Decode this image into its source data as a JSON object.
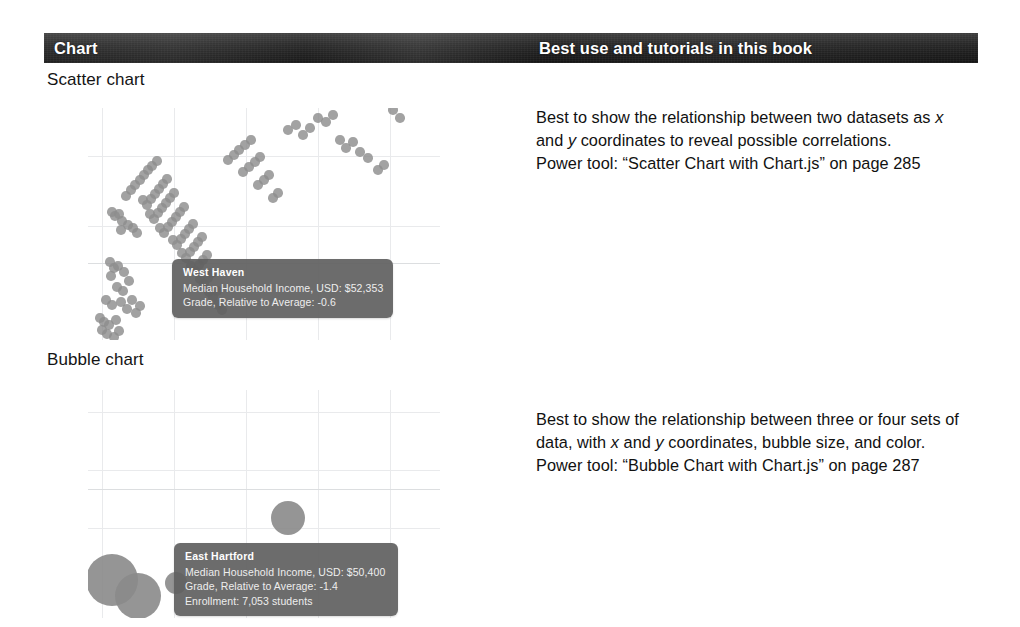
{
  "header": {
    "col_chart": "Chart",
    "col_usage": "Best use and tutorials in this book"
  },
  "sections": [
    {
      "label": "Scatter chart",
      "description_lines": [
        "Best to show the relationship between two datasets as x",
        "and y coordinates to reveal possible correlations.",
        "Power tool: “Scatter Chart with Chart.js” on page 285"
      ],
      "power_tool": "Power tool: “Scatter Chart with Chart.js” on page 285",
      "page": "285",
      "tooltip": {
        "title": "West Haven",
        "rows": [
          "Median Household Income, USD: $52,353",
          "Grade, Relative to Average: -0.6"
        ]
      }
    },
    {
      "label": "Bubble chart",
      "description_lines": [
        "Best to show the relationship between three or four sets of",
        "data, with x and y coordinates, bubble size, and color.",
        "Power tool: “Bubble Chart with Chart.js” on page 287"
      ],
      "power_tool": "Power tool: “Bubble Chart with Chart.js” on page 287",
      "page": "287",
      "tooltip": {
        "title": "East Hartford",
        "rows": [
          "Median Household Income, USD: $50,400",
          "Grade, Relative to Average: -1.4",
          "Enrollment: 7,053 students"
        ]
      }
    }
  ],
  "colors": {
    "header_bar": "#262626",
    "header_text": "#ffffff",
    "dot": "#8d8d8d",
    "bubble": "#8a8a8a",
    "gridline": "#e9eaec",
    "tooltip_bg": "#606060",
    "body_text": "#111111"
  },
  "chart_data": [
    {
      "type": "scatter",
      "title": "Scatter chart",
      "xlabel": "Median Household Income, USD",
      "ylabel": "Grade, Relative to Average",
      "grid": true,
      "legend": "none",
      "highlighted_point": {
        "label": "West Haven",
        "income_usd": 52353,
        "grade_relative_to_average": -0.6
      },
      "points": [
        [
          24,
          212
        ],
        [
          27,
          216
        ],
        [
          31,
          214
        ],
        [
          34,
          221
        ],
        [
          40,
          225
        ],
        [
          33,
          230
        ],
        [
          45,
          228
        ],
        [
          49,
          233
        ],
        [
          22,
          262
        ],
        [
          26,
          268
        ],
        [
          30,
          266
        ],
        [
          23,
          276
        ],
        [
          36,
          272
        ],
        [
          41,
          281
        ],
        [
          29,
          287
        ],
        [
          35,
          291
        ],
        [
          18,
          300
        ],
        [
          24,
          305
        ],
        [
          33,
          302
        ],
        [
          39,
          309
        ],
        [
          44,
          300
        ],
        [
          48,
          313
        ],
        [
          52,
          306
        ],
        [
          12,
          318
        ],
        [
          16,
          322
        ],
        [
          21,
          325
        ],
        [
          28,
          320
        ],
        [
          14,
          330
        ],
        [
          19,
          334
        ],
        [
          26,
          337
        ],
        [
          31,
          331
        ],
        [
          8,
          345
        ],
        [
          13,
          348
        ],
        [
          17,
          352
        ],
        [
          23,
          349
        ],
        [
          29,
          355
        ],
        [
          35,
          350
        ],
        [
          41,
          358
        ],
        [
          38,
          196
        ],
        [
          43,
          190
        ],
        [
          47,
          185
        ],
        [
          52,
          180
        ],
        [
          56,
          175
        ],
        [
          60,
          170
        ],
        [
          64,
          166
        ],
        [
          69,
          161
        ],
        [
          55,
          200
        ],
        [
          59,
          205
        ],
        [
          63,
          199
        ],
        [
          67,
          194
        ],
        [
          71,
          189
        ],
        [
          75,
          184
        ],
        [
          79,
          179
        ],
        [
          62,
          214
        ],
        [
          66,
          219
        ],
        [
          70,
          213
        ],
        [
          74,
          208
        ],
        [
          78,
          203
        ],
        [
          82,
          198
        ],
        [
          86,
          193
        ],
        [
          72,
          228
        ],
        [
          76,
          233
        ],
        [
          80,
          227
        ],
        [
          84,
          222
        ],
        [
          88,
          217
        ],
        [
          92,
          212
        ],
        [
          96,
          207
        ],
        [
          85,
          240
        ],
        [
          89,
          245
        ],
        [
          93,
          239
        ],
        [
          97,
          234
        ],
        [
          101,
          229
        ],
        [
          105,
          224
        ],
        [
          94,
          253
        ],
        [
          98,
          258
        ],
        [
          102,
          252
        ],
        [
          106,
          247
        ],
        [
          110,
          242
        ],
        [
          114,
          237
        ],
        [
          103,
          266
        ],
        [
          107,
          271
        ],
        [
          111,
          265
        ],
        [
          115,
          260
        ],
        [
          119,
          255
        ],
        [
          112,
          279
        ],
        [
          116,
          284
        ],
        [
          120,
          278
        ],
        [
          124,
          273
        ],
        [
          121,
          292
        ],
        [
          125,
          297
        ],
        [
          129,
          291
        ],
        [
          130,
          305
        ],
        [
          134,
          310
        ],
        [
          140,
          160
        ],
        [
          146,
          155
        ],
        [
          151,
          150
        ],
        [
          157,
          145
        ],
        [
          163,
          140
        ],
        [
          155,
          172
        ],
        [
          161,
          167
        ],
        [
          167,
          162
        ],
        [
          172,
          157
        ],
        [
          170,
          185
        ],
        [
          176,
          180
        ],
        [
          181,
          175
        ],
        [
          185,
          198
        ],
        [
          190,
          193
        ],
        [
          200,
          130
        ],
        [
          208,
          125
        ],
        [
          215,
          135
        ],
        [
          222,
          128
        ],
        [
          230,
          118
        ],
        [
          238,
          122
        ],
        [
          245,
          115
        ],
        [
          252,
          140
        ],
        [
          258,
          148
        ],
        [
          265,
          142
        ],
        [
          272,
          152
        ],
        [
          280,
          158
        ],
        [
          290,
          170
        ],
        [
          296,
          165
        ],
        [
          305,
          110
        ],
        [
          312,
          118
        ],
        [
          325,
          100
        ]
      ]
    },
    {
      "type": "bubble",
      "title": "Bubble chart",
      "xlabel": "Median Household Income, USD",
      "ylabel": "Grade, Relative to Average",
      "size_encodes": "Enrollment",
      "grid": true,
      "legend": "none",
      "highlighted_point": {
        "label": "East Hartford",
        "income_usd": 50400,
        "grade_relative_to_average": -1.4,
        "enrollment_students": 7053
      },
      "bubbles": [
        {
          "x": 24,
          "y": 38,
          "r": 26
        },
        {
          "x": 50,
          "y": 22,
          "r": 23
        },
        {
          "x": 88,
          "y": 35,
          "r": 11
        },
        {
          "x": 200,
          "y": 100,
          "r": 17
        }
      ]
    }
  ]
}
